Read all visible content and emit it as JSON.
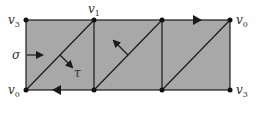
{
  "diagram": {
    "fill_color": "#a8a8a8",
    "line_color": "#1a1a1a",
    "vertex_labels": {
      "top_left": {
        "base": "v",
        "sub": "3"
      },
      "top_v1": {
        "base": "v",
        "sub": "1"
      },
      "top_right": {
        "base": "v",
        "sub": "0"
      },
      "bottom_left": {
        "base": "v",
        "sub": "0"
      },
      "bottom_right": {
        "base": "v",
        "sub": "3"
      }
    },
    "arrow_labels": {
      "sigma": "σ",
      "tau": "τ"
    }
  }
}
